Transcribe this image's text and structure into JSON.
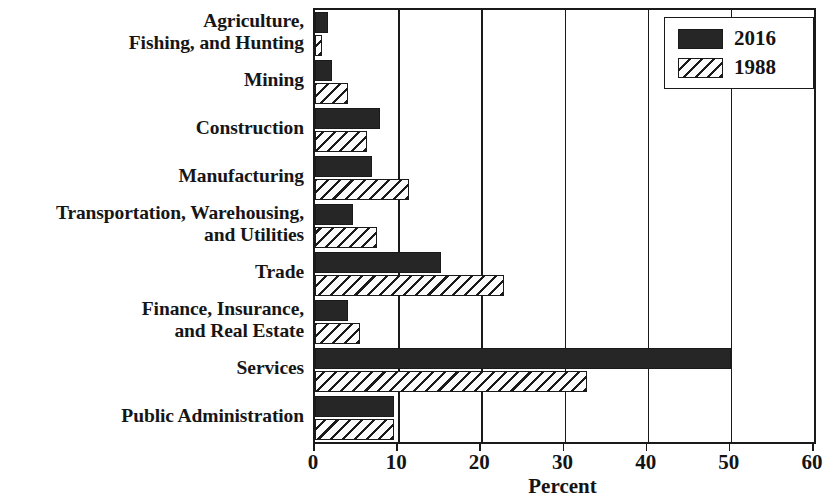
{
  "chart_data": {
    "type": "bar",
    "orientation": "horizontal",
    "title": "",
    "xlabel": "Percent",
    "ylabel": "",
    "xlim": [
      0,
      60
    ],
    "xticks": [
      0,
      10,
      20,
      30,
      40,
      50,
      60
    ],
    "grid": true,
    "legend_position": "top-right",
    "categories": [
      "Agriculture,\nFishing, and Hunting",
      "Mining",
      "Construction",
      "Manufacturing",
      "Transportation, Warehousing,\nand Utilities",
      "Trade",
      "Finance, Insurance,\nand Real Estate",
      "Services",
      "Public Administration"
    ],
    "series": [
      {
        "name": "2016",
        "fill": "solid",
        "color": "#262626",
        "values": [
          1.6,
          2.0,
          7.8,
          6.9,
          4.6,
          15.1,
          4.0,
          50.0,
          9.5
        ]
      },
      {
        "name": "1988",
        "fill": "hatched",
        "color": "#ffffff",
        "values": [
          0.8,
          4.0,
          6.3,
          11.3,
          7.4,
          22.7,
          5.4,
          32.7,
          9.5
        ]
      }
    ]
  },
  "legend": {
    "entries": [
      {
        "label": "2016",
        "swatch": "solid-black-swatch"
      },
      {
        "label": "1988",
        "swatch": "hatched-swatch"
      }
    ]
  },
  "axis": {
    "x_title": "Percent",
    "tick_labels": [
      "0",
      "10",
      "20",
      "30",
      "40",
      "50",
      "60"
    ]
  },
  "colors": {
    "series_2016": "#262626",
    "series_1988": "#ffffff",
    "axis": "#1a1a1a",
    "background": "#ffffff"
  }
}
